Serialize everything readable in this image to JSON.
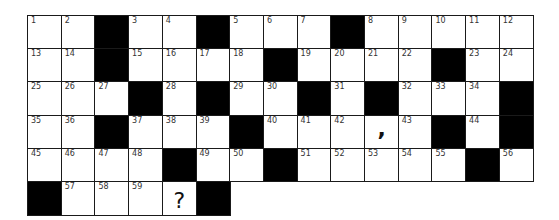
{
  "puzzle": {
    "rows": [
      [
        "1",
        "2",
        "#",
        "3",
        "4",
        "#",
        "5",
        "6",
        "7",
        "#",
        "8",
        "9",
        "10",
        "11",
        "12"
      ],
      [
        "13",
        "14",
        "#",
        "15",
        "16",
        "17",
        "18",
        "#",
        "19",
        "20",
        "21",
        "22",
        "#",
        "23",
        "24"
      ],
      [
        "25",
        "26",
        "27",
        "#",
        "28",
        "#",
        "29",
        "30",
        "#",
        "31",
        "#",
        "32",
        "33",
        "34",
        "#"
      ],
      [
        "35",
        "36",
        "#",
        "37",
        "38",
        "39",
        "#",
        "40",
        "41",
        "42",
        ",",
        "43",
        "#",
        "44",
        "#"
      ],
      [
        "45",
        "46",
        "47",
        "48",
        "#",
        "49",
        "50",
        "#",
        "51",
        "52",
        "53",
        "54",
        "55",
        "#",
        "56"
      ],
      [
        "#",
        "57",
        "58",
        "59",
        "?",
        "#"
      ]
    ],
    "cell_width": 33.7,
    "cell_height": 33.2,
    "colors": {
      "block": "#000000",
      "line": "#1a1a1a",
      "cell": "#ffffff"
    }
  }
}
